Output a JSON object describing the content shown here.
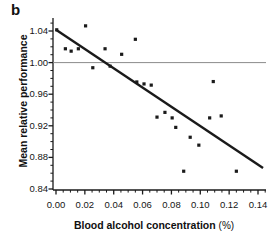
{
  "panel": {
    "label": "b"
  },
  "chart_data": {
    "type": "scatter",
    "title": "",
    "xlabel_main": "Blood alcohol concentration",
    "xlabel_unit": "(%)",
    "ylabel": "Mean relative performance",
    "xlim": [
      0.0,
      0.145
    ],
    "ylim": [
      0.84,
      1.05
    ],
    "xticks": [
      "0.00",
      "0.02",
      "0.04",
      "0.06",
      "0.08",
      "0.10",
      "0.12",
      "0.14"
    ],
    "xtick_values": [
      0.0,
      0.02,
      0.04,
      0.06,
      0.08,
      0.1,
      0.12,
      0.14
    ],
    "yticks": [
      "0.84",
      "0.88",
      "0.92",
      "0.96",
      "1.00",
      "1.04"
    ],
    "ytick_values": [
      0.84,
      0.88,
      0.92,
      0.96,
      1.0,
      1.04
    ],
    "minor_tick_interval_x": 0.005,
    "minor_tick_interval_y": 0.01,
    "grid": false,
    "legend": null,
    "marker": "square",
    "marker_color": "#1a1a1a",
    "marker_size": 3.2,
    "reference_line": {
      "orientation": "horizontal",
      "y": 1.0,
      "color": "#8c8c8c",
      "width": 1
    },
    "trend_line": {
      "type": "linear-fit",
      "color": "#1a1a1a",
      "width": 2.4,
      "x_start": 0.0,
      "y_start": 1.0415,
      "x_end": 0.1435,
      "y_end": 0.8665
    },
    "points": [
      {
        "x": 0.0005,
        "y": 1.0415
      },
      {
        "x": 0.0065,
        "y": 1.0175
      },
      {
        "x": 0.0105,
        "y": 1.0145
      },
      {
        "x": 0.0155,
        "y": 1.0175
      },
      {
        "x": 0.0205,
        "y": 1.0465
      },
      {
        "x": 0.0255,
        "y": 0.9935
      },
      {
        "x": 0.034,
        "y": 1.0175
      },
      {
        "x": 0.0375,
        "y": 0.9955
      },
      {
        "x": 0.0455,
        "y": 1.0105
      },
      {
        "x": 0.055,
        "y": 1.0295
      },
      {
        "x": 0.056,
        "y": 0.9755
      },
      {
        "x": 0.061,
        "y": 0.973
      },
      {
        "x": 0.066,
        "y": 0.9715
      },
      {
        "x": 0.07,
        "y": 0.931
      },
      {
        "x": 0.0755,
        "y": 0.937
      },
      {
        "x": 0.0805,
        "y": 0.93
      },
      {
        "x": 0.083,
        "y": 0.918
      },
      {
        "x": 0.0885,
        "y": 0.8625
      },
      {
        "x": 0.093,
        "y": 0.9055
      },
      {
        "x": 0.099,
        "y": 0.8955
      },
      {
        "x": 0.1065,
        "y": 0.93
      },
      {
        "x": 0.109,
        "y": 0.976
      },
      {
        "x": 0.1145,
        "y": 0.9325
      },
      {
        "x": 0.125,
        "y": 0.8625
      }
    ]
  }
}
